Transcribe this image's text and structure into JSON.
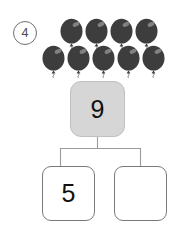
{
  "problem": {
    "number_label": "4",
    "number_display": "④"
  },
  "objects": {
    "icon_name": "balloon-icon",
    "total_count": 9,
    "color": "#3d3d3d",
    "highlight_color": "#8d8d8d",
    "rows": [
      {
        "count": 4,
        "items": [
          {
            "label": "balloon-1",
            "x": 59,
            "y": 18
          },
          {
            "label": "balloon-2",
            "x": 84,
            "y": 18
          },
          {
            "label": "balloon-3",
            "x": 109,
            "y": 18
          },
          {
            "label": "balloon-4",
            "x": 134,
            "y": 18
          }
        ]
      },
      {
        "count": 5,
        "items": [
          {
            "label": "balloon-5",
            "x": 41,
            "y": 45
          },
          {
            "label": "balloon-6",
            "x": 66,
            "y": 45
          },
          {
            "label": "balloon-7",
            "x": 91,
            "y": 45
          },
          {
            "label": "balloon-8",
            "x": 116,
            "y": 45
          },
          {
            "label": "balloon-9",
            "x": 141,
            "y": 45
          }
        ]
      }
    ]
  },
  "number_bond": {
    "total": {
      "label": "total-box",
      "value": "9",
      "fill_color": "#d6d6d6",
      "border_color": "#c0c0c0"
    },
    "parts": [
      {
        "label": "part-box-left",
        "value": "5",
        "fill_color": "#ffffff",
        "border_color": "#7a7a7a"
      },
      {
        "label": "part-box-right",
        "value": "",
        "fill_color": "#ffffff",
        "border_color": "#7a7a7a"
      }
    ],
    "connector_color": "#9b9b9b"
  }
}
